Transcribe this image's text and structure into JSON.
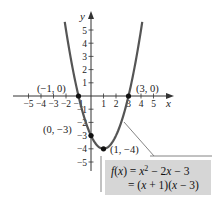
{
  "chart_data": {
    "type": "line",
    "title": "",
    "xlabel": "x",
    "ylabel": "y",
    "xlim": [
      -5,
      5
    ],
    "ylim": [
      -5,
      5
    ],
    "x_ticks": [
      -5,
      -4,
      -3,
      -2,
      -1,
      1,
      2,
      3,
      4,
      5
    ],
    "y_ticks": [
      -5,
      -4,
      -3,
      -2,
      -1,
      1,
      2,
      3,
      4,
      5
    ],
    "x_tick_labels": [
      "−5",
      "−4",
      "−3",
      "−2",
      "−1",
      "1",
      "2",
      "3",
      "4",
      "5"
    ],
    "y_tick_labels": [
      "−5",
      "−4",
      "−3",
      "−2",
      "−1",
      "1",
      "2",
      "3",
      "4",
      "5"
    ],
    "grid": false,
    "series": [
      {
        "name": "f(x) = x^2 - 2x - 3",
        "function": "x^2 - 2x - 3",
        "x": [
          -2.1,
          -1.5,
          -1,
          -0.5,
          0,
          0.5,
          1,
          1.5,
          2,
          2.5,
          3,
          3.5,
          4.1
        ],
        "values": [
          5.61,
          2.25,
          0,
          -1.75,
          -3,
          -3.75,
          -4,
          -3.75,
          -3,
          -1.75,
          0,
          2.25,
          5.61
        ]
      }
    ],
    "highlighted_points": [
      {
        "x": -1,
        "y": 0,
        "label": "(−1, 0)"
      },
      {
        "x": 3,
        "y": 0,
        "label": "(3, 0)"
      },
      {
        "x": 0,
        "y": -3,
        "label": "(0, −3)"
      },
      {
        "x": 1,
        "y": -4,
        "label": "(1, −4)"
      }
    ],
    "annotation": {
      "line1": "f(x) = x² − 2x − 3",
      "line2": "= (x + 1)(x − 3)"
    }
  },
  "labels": {
    "x_axis": "x",
    "y_axis": "y",
    "point_neg1_0": "(−1, 0)",
    "point_3_0": "(3, 0)",
    "point_0_neg3": "(0, −3)",
    "point_1_neg4": "(1, −4)",
    "eq_line1_f": "f",
    "eq_line1_rest_a": "(",
    "eq_line1_x": "x",
    "eq_line1_rest_b": ") = ",
    "eq_line1_x2": "x",
    "eq_line1_sup": "2",
    "eq_line1_tail_a": " − 2",
    "eq_line1_x3": "x",
    "eq_line1_tail_b": " − 3",
    "eq_line2_a": "= (",
    "eq_line2_x1": "x",
    "eq_line2_b": " + 1)(",
    "eq_line2_x2": "x",
    "eq_line2_c": " − 3)"
  },
  "colors": {
    "curve": "#555555",
    "axis": "#333333",
    "box_fill": "#d6d6d6",
    "box_outline": "#777777"
  }
}
